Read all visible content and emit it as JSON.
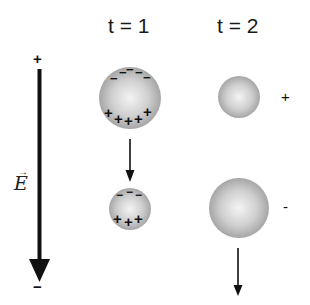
{
  "diagram": {
    "columns": [
      {
        "label": "t = 1"
      },
      {
        "label": "t = 2"
      }
    ],
    "field": {
      "label": "E",
      "top_sign": "+",
      "bottom_sign": "−"
    },
    "t1": {
      "top_sphere": {
        "negative_charges": [
          "−",
          "−",
          "−",
          "−",
          "−"
        ],
        "positive_charges": [
          "+",
          "+",
          "+",
          "+",
          "+",
          "+"
        ]
      },
      "bottom_sphere": {
        "negative_charges": [
          "−",
          "−",
          "−"
        ],
        "positive_charges": [
          "+",
          "+",
          "+"
        ]
      }
    },
    "t2": {
      "top_sphere_sign": "+",
      "bottom_sphere_sign": "-"
    },
    "colors": {
      "sphere_center": "#f2f2f2",
      "sphere_edge": "#a8a8a8",
      "arrow": "#111111"
    }
  }
}
